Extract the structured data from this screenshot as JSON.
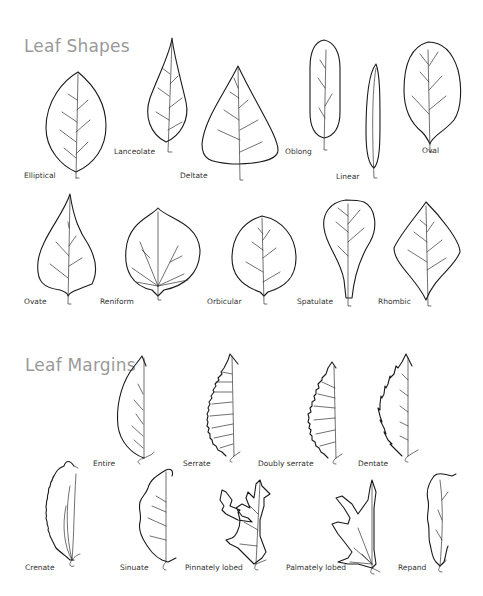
{
  "sections": {
    "shapes": {
      "title": "Leaf Shapes",
      "items": [
        {
          "id": "elliptical",
          "label": "Elliptical"
        },
        {
          "id": "lanceolate",
          "label": "Lanceolate"
        },
        {
          "id": "deltate",
          "label": "Deltate"
        },
        {
          "id": "oblong",
          "label": "Oblong"
        },
        {
          "id": "linear",
          "label": "Linear"
        },
        {
          "id": "oval",
          "label": "Oval"
        },
        {
          "id": "ovate",
          "label": "Ovate"
        },
        {
          "id": "reniform",
          "label": "Reniform"
        },
        {
          "id": "orbicular",
          "label": "Orbicular"
        },
        {
          "id": "spatulate",
          "label": "Spatulate"
        },
        {
          "id": "rhombic",
          "label": "Rhombic"
        }
      ]
    },
    "margins": {
      "title": "Leaf Margins",
      "items": [
        {
          "id": "entire",
          "label": "Entire"
        },
        {
          "id": "serrate",
          "label": "Serrate"
        },
        {
          "id": "doubly-serrate",
          "label": "Doubly serrate"
        },
        {
          "id": "dentate",
          "label": "Dentate"
        },
        {
          "id": "crenate",
          "label": "Crenate"
        },
        {
          "id": "sinuate",
          "label": "Sinuate"
        },
        {
          "id": "pinnately-lobed",
          "label": "Pinnately lobed"
        },
        {
          "id": "palmately-lobed",
          "label": "Palmately lobed"
        },
        {
          "id": "repand",
          "label": "Repand"
        }
      ]
    }
  }
}
